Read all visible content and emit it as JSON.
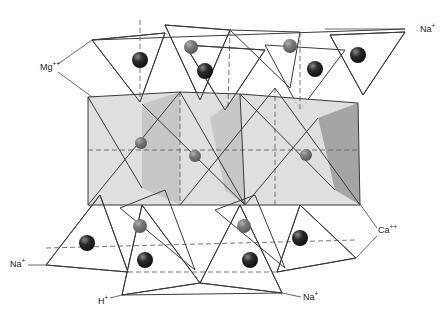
{
  "diagram": {
    "title": "Crystal structure of an amphibole (tetrahedral chains linked by octahedral layer)",
    "colors": {
      "face_light": "#dcdcdc",
      "face_mid": "#c4c4c4",
      "face_dark": "#9e9e9e",
      "face_pale": "#ececec",
      "atom_dark": "#2a2a2a",
      "atom_mid": "#7a7a7a",
      "edge": "#3a3a3a"
    },
    "labels": [
      {
        "id": "mg",
        "ion": "Mg",
        "charge": "++",
        "x": 40,
        "y": 70
      },
      {
        "id": "na-top",
        "ion": "Na",
        "charge": "+",
        "x": 420,
        "y": 32
      },
      {
        "id": "ca",
        "ion": "Ca",
        "charge": "++",
        "x": 378,
        "y": 233
      },
      {
        "id": "na-left",
        "ion": "Na",
        "charge": "+",
        "x": 10,
        "y": 267
      },
      {
        "id": "h",
        "ion": "H",
        "charge": "+",
        "x": 98,
        "y": 304
      },
      {
        "id": "na-bottom",
        "ion": "Na",
        "charge": "+",
        "x": 303,
        "y": 300
      }
    ],
    "leaders": [
      {
        "id": "mg-up",
        "points": "58,64 92,40"
      },
      {
        "id": "mg-down",
        "points": "58,72 92,97"
      },
      {
        "id": "na-top",
        "points": "405,29 325,29"
      },
      {
        "id": "ca-up",
        "points": "377,228 360,204"
      },
      {
        "id": "ca-down",
        "points": "377,236 356,258"
      },
      {
        "id": "na-left",
        "points": "28,265 46,265"
      },
      {
        "id": "h",
        "points": "110,298 122,295"
      },
      {
        "id": "na-bottom",
        "points": "301,297 282,293"
      }
    ],
    "octahedra": [
      {
        "id": "oct-1",
        "faces": [
          {
            "points": "88,97 180,92 180,205 88,205",
            "fill": "face_light"
          },
          {
            "points": "142,104 180,92 180,205 142,188",
            "fill": "face_mid"
          }
        ]
      },
      {
        "id": "oct-2",
        "faces": [
          {
            "points": "180,92 240,94 245,205 180,205",
            "fill": "face_light"
          },
          {
            "points": "210,118 240,94 245,205 225,190",
            "fill": "face_mid"
          }
        ]
      },
      {
        "id": "oct-3",
        "faces": [
          {
            "points": "240,94 358,103 360,205 245,205",
            "fill": "face_light"
          },
          {
            "points": "318,118 358,103 360,205 335,190",
            "fill": "face_dark"
          }
        ]
      }
    ],
    "tetrahedra_top": [
      {
        "id": "tet-t1",
        "points": "92,40 165,33 140,102",
        "fill": "face_light"
      },
      {
        "id": "tet-t2",
        "points": "165,25 230,30 200,100",
        "fill": "face_dark"
      },
      {
        "id": "tet-t3",
        "points": "185,45 265,50 225,110",
        "fill": "face_mid"
      },
      {
        "id": "tet-t4",
        "points": "230,30 300,32 290,88",
        "fill": "face_light"
      },
      {
        "id": "tet-t5",
        "points": "265,45 345,50 300,110",
        "fill": "face_light"
      },
      {
        "id": "tet-t6",
        "points": "330,35 405,32 363,95",
        "fill": "face_dark"
      }
    ],
    "tetrahedra_bottom": [
      {
        "id": "tet-b1",
        "points": "46,265 100,195 128,272",
        "fill": "face_light"
      },
      {
        "id": "tet-b2",
        "points": "122,295 142,205 200,283",
        "fill": "face_dark"
      },
      {
        "id": "tet-b3",
        "points": "120,208 165,190 195,270",
        "fill": "face_light"
      },
      {
        "id": "tet-b4",
        "points": "200,283 240,205 282,293",
        "fill": "face_pale"
      },
      {
        "id": "tet-b5",
        "points": "215,210 255,195 285,268",
        "fill": "face_light"
      },
      {
        "id": "tet-b6",
        "points": "277,272 300,205 356,258",
        "fill": "face_dark"
      }
    ],
    "atoms": [
      {
        "id": "atom-1",
        "cx": 140,
        "cy": 60,
        "r": 8,
        "fill": "atom_dark"
      },
      {
        "id": "atom-2",
        "cx": 191,
        "cy": 47,
        "r": 7,
        "fill": "atom_mid"
      },
      {
        "id": "atom-3",
        "cx": 205,
        "cy": 71,
        "r": 8,
        "fill": "atom_dark"
      },
      {
        "id": "atom-4",
        "cx": 290,
        "cy": 46,
        "r": 7,
        "fill": "atom_mid"
      },
      {
        "id": "atom-5",
        "cx": 315,
        "cy": 69,
        "r": 8,
        "fill": "atom_dark"
      },
      {
        "id": "atom-6",
        "cx": 358,
        "cy": 55,
        "r": 8,
        "fill": "atom_dark"
      },
      {
        "id": "atom-7",
        "cx": 141,
        "cy": 143,
        "r": 6,
        "fill": "atom_mid"
      },
      {
        "id": "atom-8",
        "cx": 195,
        "cy": 156,
        "r": 6,
        "fill": "atom_mid"
      },
      {
        "id": "atom-9",
        "cx": 306,
        "cy": 155,
        "r": 6,
        "fill": "atom_mid"
      },
      {
        "id": "atom-10",
        "cx": 87,
        "cy": 243,
        "r": 8,
        "fill": "atom_dark"
      },
      {
        "id": "atom-11",
        "cx": 140,
        "cy": 226,
        "r": 7,
        "fill": "atom_mid"
      },
      {
        "id": "atom-12",
        "cx": 145,
        "cy": 260,
        "r": 8,
        "fill": "atom_dark"
      },
      {
        "id": "atom-13",
        "cx": 244,
        "cy": 226,
        "r": 7,
        "fill": "atom_mid"
      },
      {
        "id": "atom-14",
        "cx": 250,
        "cy": 260,
        "r": 8,
        "fill": "atom_dark"
      },
      {
        "id": "atom-15",
        "cx": 300,
        "cy": 238,
        "r": 8,
        "fill": "atom_dark"
      }
    ],
    "solid_edges": [
      "88,97 180,92",
      "180,92 240,94",
      "240,94 358,103",
      "88,97 88,205",
      "358,103 360,205",
      "88,205 360,205",
      "88,205 180,92",
      "180,92 245,205",
      "245,205 240,94",
      "88,97 142,188",
      "142,104 245,205",
      "180,205 275,88",
      "275,88 360,205",
      "245,205 318,118",
      "240,94 335,190",
      "92,40 165,33",
      "165,33 140,102",
      "92,40 140,102",
      "165,25 230,30",
      "230,30 200,100",
      "165,25 200,100",
      "185,45 265,50",
      "265,50 225,110",
      "185,45 225,110",
      "330,35 405,32",
      "405,32 363,95",
      "330,35 363,95",
      "92,40 405,29",
      "46,265 100,195",
      "100,195 128,272",
      "46,265 128,272",
      "122,295 142,205",
      "142,205 200,283",
      "122,295 200,283",
      "200,283 240,205",
      "240,205 282,293",
      "200,283 282,293",
      "277,272 300,205",
      "300,205 356,258",
      "277,272 356,258",
      "122,295 282,293"
    ],
    "dashed_edges": [
      "88,150 360,150",
      "180,92 180,205",
      "275,88 275,205",
      "46,248 356,240",
      "128,272 277,272",
      "140,20 140,102",
      "300,32 300,110",
      "230,30 228,108"
    ]
  }
}
